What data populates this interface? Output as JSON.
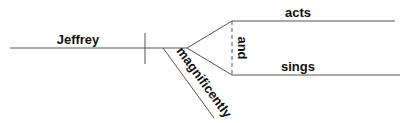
{
  "diagram": {
    "type": "sentence-diagram",
    "subject": "Jeffrey",
    "modifier": "magnificently",
    "conjunction": "and",
    "predicates": [
      "acts",
      "sings"
    ],
    "line_color": "#555555",
    "text_color": "#111111"
  }
}
